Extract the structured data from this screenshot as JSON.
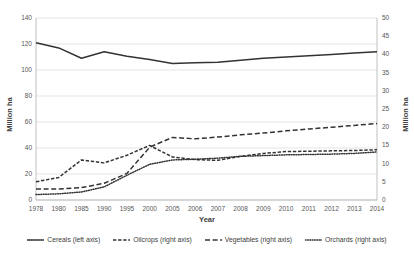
{
  "chart_data": {
    "type": "line",
    "title": "",
    "xlabel": "Year",
    "ylabel": "Million ha",
    "ylabel_right": "Million ha",
    "x": [
      1978,
      1980,
      1985,
      1990,
      1995,
      2000,
      2005,
      2006,
      2007,
      2008,
      2009,
      2010,
      2011,
      2012,
      2013,
      2014
    ],
    "xtick_labels": [
      "1978",
      "1980",
      "1985",
      "1990",
      "1995",
      "2000",
      "2005",
      "2006",
      "2007",
      "2008",
      "2009",
      "2010",
      "2011",
      "2012",
      "2013",
      "2014"
    ],
    "ylim": [
      0,
      140
    ],
    "ytick_labels": [
      "0",
      "20",
      "40",
      "60",
      "80",
      "100",
      "120",
      "140"
    ],
    "ytick_values": [
      0,
      20,
      40,
      60,
      80,
      100,
      120,
      140
    ],
    "ylim_right": [
      0,
      50
    ],
    "ytick_labels_right": [
      "0",
      "5",
      "10",
      "15",
      "20",
      "25",
      "30",
      "35",
      "40",
      "45",
      "50"
    ],
    "ytick_values_right": [
      0,
      5,
      10,
      15,
      20,
      25,
      30,
      35,
      40,
      45,
      50
    ],
    "grid": true,
    "grid_axis": "y",
    "legend_position": "bottom",
    "series": [
      {
        "name": "Cereals (left axis)",
        "legend_label": "Cereals (left axis)",
        "axis": "left",
        "style": "solid",
        "color": "#333333",
        "values": [
          121,
          117,
          109,
          114,
          110.5,
          108,
          105,
          105.5,
          106,
          107.5,
          109,
          110,
          111,
          112,
          113,
          114
        ]
      },
      {
        "name": "Oilcrops (right axis)",
        "legend_label": "Oilcrops (right axis)",
        "axis": "right",
        "style": "dashdot",
        "color": "#333333",
        "values": [
          5.0,
          6.2,
          11.0,
          10.2,
          12.3,
          15.0,
          11.8,
          11.1,
          10.9,
          12.0,
          12.8,
          13.3,
          13.4,
          13.5,
          13.6,
          13.8
        ]
      },
      {
        "name": "Vegetables (right axis)",
        "legend_label": "Vegetables (right axis)",
        "axis": "right",
        "style": "dashed",
        "color": "#333333",
        "values": [
          3.0,
          3.0,
          3.4,
          4.6,
          7.3,
          14.5,
          17.2,
          16.8,
          17.3,
          17.9,
          18.4,
          19.0,
          19.5,
          20.0,
          20.5,
          21.0
        ]
      },
      {
        "name": "Orchards (right axis)",
        "legend_label": "Orchards (right axis)",
        "axis": "right",
        "style": "dotted",
        "color": "#333333",
        "values": [
          1.5,
          1.7,
          2.2,
          3.6,
          6.8,
          9.8,
          11.0,
          11.2,
          11.5,
          12.0,
          12.2,
          12.4,
          12.5,
          12.6,
          12.8,
          13.2
        ]
      }
    ]
  }
}
